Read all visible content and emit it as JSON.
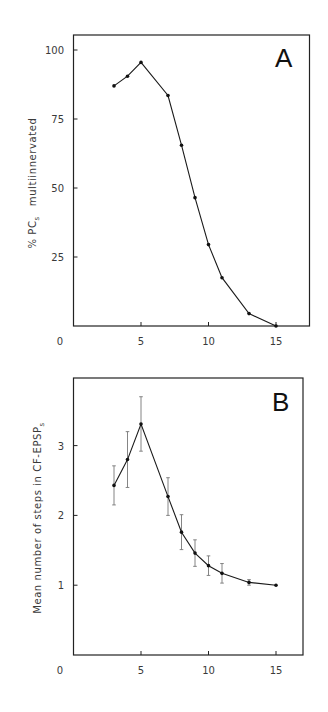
{
  "figure": {
    "panels": [
      "A",
      "B"
    ]
  },
  "chart_data": [
    {
      "type": "line",
      "panel_label": "A",
      "title": "",
      "xlabel": "",
      "ylabel": "% PCs multiinnervated",
      "ylabel_main": "% PC",
      "ylabel_sub": "s",
      "ylabel_rest": "multiinnervated",
      "xlim": [
        0,
        17.5
      ],
      "ylim": [
        0,
        105
      ],
      "xticks": [
        0,
        5,
        10,
        15
      ],
      "xtick_labels": [
        "0",
        "5",
        "10",
        "15"
      ],
      "yticks": [
        25,
        50,
        75,
        100
      ],
      "ytick_labels": [
        "25",
        "50",
        "75",
        "100"
      ],
      "grid": false,
      "legend": null,
      "series": [
        {
          "name": "% PCs multiinnervated",
          "x": [
            3,
            4,
            5,
            7,
            8,
            9,
            10,
            11,
            13,
            15
          ],
          "y": [
            87,
            90.5,
            95.5,
            83.5,
            65.5,
            46.5,
            29.5,
            17.5,
            4.5,
            0
          ]
        }
      ]
    },
    {
      "type": "line",
      "panel_label": "B",
      "title": "",
      "xlabel": "",
      "ylabel": "Mean number of steps in CF-EPSPs",
      "ylabel_main": "Mean number of steps in CF-EPSP",
      "ylabel_sub": "s",
      "ylabel_rest": "",
      "xlim": [
        0,
        17.5
      ],
      "ylim": [
        0,
        4.0
      ],
      "xticks": [
        0,
        5,
        10,
        15
      ],
      "xtick_labels": [
        "0",
        "5",
        "10",
        "15"
      ],
      "yticks": [
        1,
        2,
        3
      ],
      "ytick_labels": [
        "1",
        "2",
        "3"
      ],
      "grid": false,
      "legend": null,
      "series": [
        {
          "name": "Mean number of steps",
          "x": [
            3,
            4,
            5,
            7,
            8,
            9,
            10,
            11,
            13,
            15
          ],
          "y": [
            2.43,
            2.8,
            3.31,
            2.27,
            1.76,
            1.46,
            1.28,
            1.17,
            1.04,
            1.0
          ],
          "error": [
            0.28,
            0.4,
            0.39,
            0.27,
            0.25,
            0.19,
            0.14,
            0.14,
            0.04,
            0
          ]
        }
      ]
    }
  ]
}
